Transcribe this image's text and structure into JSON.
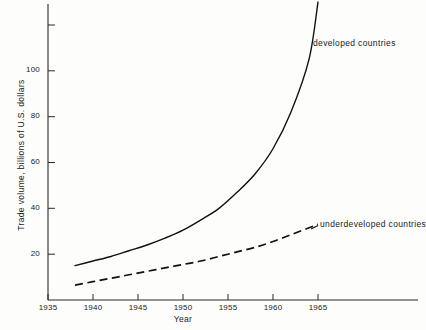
{
  "chart_data": {
    "type": "line",
    "title": "",
    "xlabel": "Year",
    "ylabel": "Trade volume, billions of U.S. dollars",
    "xlim": [
      1935,
      1968
    ],
    "ylim": [
      0,
      123
    ],
    "grid": false,
    "legend_position": "inline-annotation",
    "x_ticks": [
      1935,
      1940,
      1945,
      1950,
      1955,
      1960,
      1965
    ],
    "x_tick_labels": [
      "1935",
      "1940",
      "1945",
      "1950",
      "1955",
      "1960",
      "1965"
    ],
    "y_ticks": [
      20,
      40,
      60,
      80,
      100,
      120
    ],
    "y_tick_labels": [
      "20",
      "40",
      "60",
      "80",
      "100",
      ""
    ],
    "series": [
      {
        "name": "developed countries",
        "style": "solid",
        "color": "#111111",
        "x": [
          1938,
          1940,
          1942,
          1944,
          1946,
          1948,
          1950,
          1952,
          1954,
          1956,
          1958,
          1960,
          1962,
          1964,
          1965
        ],
        "values": [
          15,
          17,
          19,
          21.5,
          24,
          27,
          30.5,
          35,
          40,
          47,
          55,
          66,
          82,
          105,
          130
        ]
      },
      {
        "name": "underdeveloped countries",
        "style": "dashed",
        "color": "#111111",
        "x": [
          1938,
          1940,
          1942,
          1944,
          1946,
          1948,
          1950,
          1952,
          1954,
          1956,
          1958,
          1960,
          1962,
          1964,
          1965
        ],
        "values": [
          6.5,
          8,
          9.5,
          11,
          12.5,
          14,
          15.5,
          17,
          19,
          21,
          23,
          25.5,
          28.5,
          31.5,
          33
        ]
      }
    ],
    "annotations": [
      {
        "text": "developed countries",
        "x": 1965,
        "y": 112
      },
      {
        "text": "underdeveloped countries",
        "x": 1965,
        "y": 38
      }
    ]
  },
  "axis": {
    "y_title": "Trade volume, billions of U.S. dollars",
    "x_title": "Year"
  }
}
